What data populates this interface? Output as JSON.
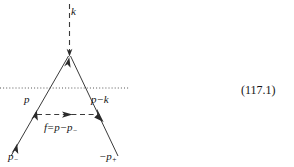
{
  "figure": {
    "kind": "feynman-diagram",
    "background_color": "#ffffff",
    "line_color": "#333333",
    "text_color": "#141414",
    "equation_number": "(117.1)",
    "labels": {
      "photon": "k",
      "left_incoming": "p",
      "right_outgoing_base": "p",
      "right_outgoing_op": "−",
      "right_outgoing_term": "k",
      "transfer_f": "f",
      "transfer_eq": "=",
      "transfer_p": "p",
      "transfer_op": "−",
      "transfer_p_sub_base": "p",
      "transfer_p_sub": "−",
      "electron_base": "p",
      "electron_sub": "−",
      "positron_op": "−",
      "positron_base": "p",
      "positron_sub": "+"
    },
    "elements": {
      "photon_line": "dashed-vertical",
      "cut_line": "dotted-horizontal",
      "transfer_line": "dashed-horizontal-arrow",
      "left_fermion_line": "solid-diagonal-up",
      "right_fermion_line": "solid-diagonal-down"
    }
  }
}
